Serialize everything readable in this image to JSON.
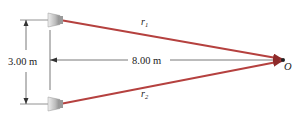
{
  "diagram": {
    "labels": {
      "vertical_distance": "3.00 m",
      "horizontal_distance": "8.00 m",
      "ray1": "r",
      "ray1_sub": "1",
      "ray2": "r",
      "ray2_sub": "2",
      "point": "O"
    },
    "objects": {
      "speakers": [
        "speaker-top",
        "speaker-bottom"
      ],
      "rays": [
        "r1",
        "r2"
      ],
      "point": "O"
    },
    "colors": {
      "ray": "#b5413f",
      "ray_dark": "#8e2b2a",
      "dimension_line": "#555555",
      "speaker_light": "#d4d4d4",
      "speaker_dark": "#8a8a8a",
      "point": "#222222"
    }
  }
}
